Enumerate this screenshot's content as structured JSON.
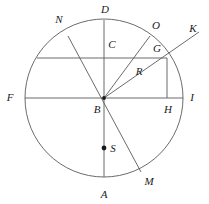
{
  "figure": {
    "kind": "circle-geometry-diagram",
    "background_color": "#ffffff",
    "stroke_color": "#5a5a5a",
    "label_color": "#1a1a1a",
    "circle": {
      "cx": 104,
      "cy": 98,
      "r": 79
    },
    "points": [
      {
        "name": "D",
        "label": "D",
        "x": 104,
        "y": 20,
        "label_x": 105,
        "label_y": 9,
        "on_circle": true
      },
      {
        "name": "A",
        "label": "A",
        "x": 104,
        "y": 177,
        "label_x": 104,
        "label_y": 194,
        "on_circle": true
      },
      {
        "name": "F",
        "label": "F",
        "x": 25,
        "y": 98,
        "label_x": 10,
        "label_y": 97,
        "on_circle": true
      },
      {
        "name": "I",
        "label": "I",
        "x": 183,
        "y": 98,
        "label_x": 192,
        "label_y": 97,
        "on_circle": true
      },
      {
        "name": "N",
        "label": "N",
        "x": 68,
        "y": 36,
        "label_x": 59,
        "label_y": 19,
        "on_circle": true
      },
      {
        "name": "O",
        "label": "O",
        "x": 150,
        "y": 36,
        "label_x": 156,
        "label_y": 25,
        "on_circle": true
      },
      {
        "name": "M",
        "label": "M",
        "x": 141,
        "y": 172,
        "label_x": 149,
        "label_y": 181,
        "on_circle": true
      },
      {
        "name": "B",
        "label": "B",
        "x": 104,
        "y": 98,
        "label_x": 97,
        "label_y": 109,
        "on_circle": false
      },
      {
        "name": "C",
        "label": "C",
        "x": 104,
        "y": 58,
        "label_x": 112,
        "label_y": 44,
        "on_circle": false
      },
      {
        "name": "G",
        "label": "G",
        "x": 167,
        "y": 58,
        "label_x": 157,
        "label_y": 48,
        "on_circle": false
      },
      {
        "name": "H",
        "label": "H",
        "x": 167,
        "y": 98,
        "label_x": 168,
        "label_y": 109,
        "on_circle": false
      },
      {
        "name": "R",
        "label": "R",
        "x": 137,
        "y": 78,
        "label_x": 139,
        "label_y": 71,
        "on_circle": false
      },
      {
        "name": "K",
        "label": "K",
        "x": 199,
        "y": 32,
        "label_x": 193,
        "label_y": 28,
        "on_circle": false
      },
      {
        "name": "S",
        "label": "S",
        "x": 104,
        "y": 148,
        "label_x": 113,
        "label_y": 148,
        "on_circle": false
      }
    ],
    "segments": [
      {
        "name": "diameter-FI",
        "x1": 25,
        "y1": 98,
        "x2": 183,
        "y2": 98
      },
      {
        "name": "diameter-DA",
        "x1": 104,
        "y1": 20,
        "x2": 104,
        "y2": 177
      },
      {
        "name": "chord-horizontal-CG",
        "x1": 37,
        "y1": 58,
        "x2": 167,
        "y2": 58
      },
      {
        "name": "diameter-NM",
        "x1": 68,
        "y1": 36,
        "x2": 141,
        "y2": 172
      },
      {
        "name": "radius-BO",
        "x1": 104,
        "y1": 98,
        "x2": 150,
        "y2": 36
      },
      {
        "name": "ray-BK",
        "x1": 104,
        "y1": 98,
        "x2": 199,
        "y2": 32
      },
      {
        "name": "perpendicular-GH",
        "x1": 167,
        "y1": 58,
        "x2": 167,
        "y2": 98
      }
    ],
    "dots": [
      {
        "name": "center-dot-B",
        "x": 104,
        "y": 98,
        "r": 1.9
      },
      {
        "name": "point-dot-S",
        "x": 104,
        "y": 148,
        "r": 2.4
      }
    ]
  }
}
